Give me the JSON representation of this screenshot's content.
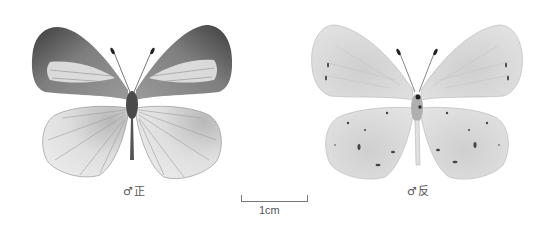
{
  "specimens": [
    {
      "id": "upperside",
      "label": "♂正",
      "view": "male upperside"
    },
    {
      "id": "underside",
      "label": "♂反",
      "view": "male underside"
    }
  ],
  "scale": {
    "label": "1cm"
  },
  "colors": {
    "background": "#ffffff",
    "upper_forewing": "#8a8a8a",
    "upper_forewing_dark": "#4a4a4a",
    "upper_patch": "#e6e6e6",
    "upper_hindwing": "#dcdcdc",
    "under_wing": "#e2e2e2",
    "vein": "#9a9a9a",
    "spot": "#444444"
  }
}
